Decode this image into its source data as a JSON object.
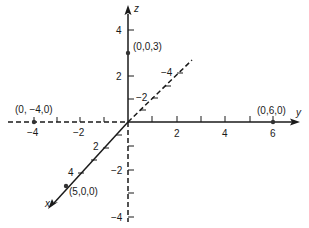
{
  "colors": {
    "axis": "#1a1a1a",
    "background": "#ffffff"
  },
  "axes": {
    "x": {
      "label": "x",
      "tick_labels": {
        "pos_2": "2",
        "pos_4": "4",
        "neg_2": "−2",
        "neg_4": "−4"
      }
    },
    "y": {
      "label": "y",
      "tick_labels": {
        "pos_2": "2",
        "pos_4": "4",
        "pos_6": "6",
        "neg_2": "−2",
        "neg_4": "−4"
      }
    },
    "z": {
      "label": "z",
      "tick_labels": {
        "pos_2": "2",
        "pos_4": "4",
        "neg_2": "−2",
        "neg_4": "−4"
      }
    }
  },
  "points": [
    {
      "label": "(0,0,3)",
      "coords": [
        0,
        0,
        3
      ]
    },
    {
      "label": "(0, −4,0)",
      "coords": [
        0,
        -4,
        0
      ]
    },
    {
      "label": "(0,6,0)",
      "coords": [
        0,
        6,
        0
      ]
    },
    {
      "label": "(5,0,0)",
      "coords": [
        5,
        0,
        0
      ]
    }
  ]
}
